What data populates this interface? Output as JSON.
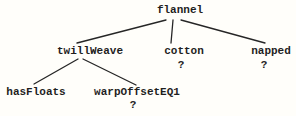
{
  "diagram": {
    "type": "tree",
    "root": "flannel",
    "colors": {
      "background": "#fffefa",
      "ink": "#1f1f1f"
    },
    "nodes": {
      "flannel": {
        "label": "flannel",
        "children": [
          "twillWeave",
          "cotton",
          "napped"
        ]
      },
      "twillWeave": {
        "label": "twillWeave",
        "children": [
          "hasFloats",
          "warpOffsetEQ1"
        ]
      },
      "cotton": {
        "label": "cotton",
        "mark": "?"
      },
      "napped": {
        "label": "napped",
        "mark": "?"
      },
      "hasFloats": {
        "label": "hasFloats"
      },
      "warpOffsetEQ1": {
        "label": "warpOffsetEQ1",
        "mark": "?"
      }
    },
    "edges": [
      {
        "from": "flannel",
        "to": "twillWeave"
      },
      {
        "from": "flannel",
        "to": "cotton"
      },
      {
        "from": "flannel",
        "to": "napped"
      },
      {
        "from": "twillWeave",
        "to": "hasFloats"
      },
      {
        "from": "twillWeave",
        "to": "warpOffsetEQ1"
      }
    ]
  }
}
